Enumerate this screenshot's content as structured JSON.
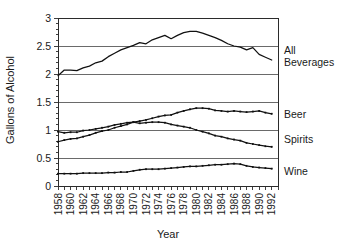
{
  "chart_data": {
    "type": "line",
    "title": "",
    "subtitle": "",
    "xlabel": "Year",
    "ylabel": "Gallons of Alcohol",
    "xlim": [
      1958,
      1993
    ],
    "ylim": [
      0,
      3
    ],
    "yticks": [
      "0",
      "0.5",
      "1",
      "1.5",
      "2",
      "2.5",
      "3"
    ],
    "ytick_values": [
      0,
      0.5,
      1,
      1.5,
      2,
      2.5,
      3
    ],
    "xticks": [
      "1958",
      "1960",
      "1962",
      "1964",
      "1966",
      "1968",
      "1970",
      "1972",
      "1974",
      "1976",
      "1978",
      "1980",
      "1982",
      "1984",
      "1986",
      "1988",
      "1990",
      "1992"
    ],
    "xtick_values": [
      1958,
      1960,
      1962,
      1964,
      1966,
      1968,
      1970,
      1972,
      1974,
      1976,
      1978,
      1980,
      1982,
      1984,
      1986,
      1988,
      1990,
      1992
    ],
    "minor_xtick_values": [
      1958,
      1959,
      1960,
      1961,
      1962,
      1963,
      1964,
      1965,
      1966,
      1967,
      1968,
      1969,
      1970,
      1971,
      1972,
      1973,
      1974,
      1975,
      1976,
      1977,
      1978,
      1979,
      1980,
      1981,
      1982,
      1983,
      1984,
      1985,
      1986,
      1987,
      1988,
      1989,
      1990,
      1991,
      1992,
      1993
    ],
    "grid": "horizontal",
    "legend_position": "right-inline",
    "line_color": "#111111",
    "grid_color": "#5a5a5a",
    "axis_color": "#2b2b2b",
    "x": [
      1958,
      1959,
      1960,
      1961,
      1962,
      1963,
      1964,
      1965,
      1966,
      1967,
      1968,
      1969,
      1970,
      1971,
      1972,
      1973,
      1974,
      1975,
      1976,
      1977,
      1978,
      1979,
      1980,
      1981,
      1982,
      1983,
      1984,
      1985,
      1986,
      1987,
      1988,
      1989,
      1990,
      1991,
      1992
    ],
    "series": [
      {
        "name": "All Beverages",
        "label_lines": [
          "All",
          "Beverages"
        ],
        "label_y_value": 2.35,
        "markers": false,
        "values": [
          1.97,
          2.07,
          2.07,
          2.06,
          2.11,
          2.14,
          2.2,
          2.23,
          2.31,
          2.37,
          2.43,
          2.47,
          2.51,
          2.56,
          2.54,
          2.61,
          2.65,
          2.69,
          2.63,
          2.69,
          2.74,
          2.76,
          2.76,
          2.73,
          2.69,
          2.65,
          2.6,
          2.54,
          2.5,
          2.48,
          2.43,
          2.47,
          2.35,
          2.3,
          2.25
        ]
      },
      {
        "name": "Beer",
        "label_lines": [
          "Beer"
        ],
        "label_y_value": 1.22,
        "markers": true,
        "values": [
          0.79,
          0.82,
          0.84,
          0.85,
          0.88,
          0.91,
          0.95,
          0.98,
          1.0,
          1.04,
          1.07,
          1.1,
          1.14,
          1.16,
          1.18,
          1.21,
          1.24,
          1.26,
          1.27,
          1.31,
          1.34,
          1.37,
          1.39,
          1.39,
          1.38,
          1.35,
          1.34,
          1.33,
          1.34,
          1.33,
          1.32,
          1.33,
          1.34,
          1.31,
          1.29
        ]
      },
      {
        "name": "Spirits",
        "label_lines": [
          "Spirits"
        ],
        "label_y_value": 0.77,
        "markers": true,
        "values": [
          0.97,
          0.95,
          0.96,
          0.96,
          0.99,
          1.0,
          1.02,
          1.04,
          1.06,
          1.09,
          1.11,
          1.13,
          1.14,
          1.12,
          1.13,
          1.14,
          1.14,
          1.13,
          1.1,
          1.08,
          1.06,
          1.04,
          1.0,
          0.97,
          0.94,
          0.9,
          0.88,
          0.85,
          0.83,
          0.81,
          0.77,
          0.75,
          0.73,
          0.71,
          0.7
        ]
      },
      {
        "name": "Wine",
        "label_lines": [
          "Wine"
        ],
        "label_y_value": 0.2,
        "markers": true,
        "values": [
          0.22,
          0.22,
          0.22,
          0.22,
          0.23,
          0.23,
          0.23,
          0.23,
          0.24,
          0.24,
          0.25,
          0.25,
          0.27,
          0.29,
          0.3,
          0.3,
          0.3,
          0.31,
          0.32,
          0.33,
          0.34,
          0.35,
          0.35,
          0.36,
          0.37,
          0.38,
          0.38,
          0.39,
          0.4,
          0.39,
          0.36,
          0.34,
          0.33,
          0.32,
          0.31
        ]
      }
    ]
  }
}
